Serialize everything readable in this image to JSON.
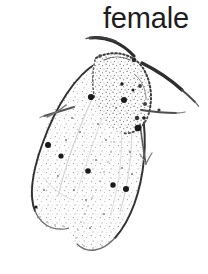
{
  "figure": {
    "caption": "female",
    "caption_color": "#1d1d1d",
    "background_color": "#ffffff",
    "style": "pen-and-ink scientific illustration",
    "width": 208,
    "height": 274
  },
  "illustration": {
    "ink_color": "#2b2b2b",
    "outline_color": "#3a3a3a",
    "stipple_color": "#8a8a8a",
    "spot_color": "#1a1a1a",
    "fill_color": "#fdfdfd",
    "parts": [
      {
        "name": "left-antenna",
        "label": "left antenna"
      },
      {
        "name": "right-antenna",
        "label": "right antenna"
      },
      {
        "name": "head",
        "label": "head"
      },
      {
        "name": "thorax",
        "label": "thorax"
      },
      {
        "name": "left-forewing",
        "label": "left forewing"
      },
      {
        "name": "right-forewing",
        "label": "right forewing"
      },
      {
        "name": "left-leg",
        "label": "left leg"
      },
      {
        "name": "right-leg",
        "label": "right leg"
      },
      {
        "name": "wing-spots",
        "label": "wing spots"
      },
      {
        "name": "wing-stipple",
        "label": "wing stippling"
      }
    ],
    "spots": [
      {
        "cx": 91,
        "cy": 97,
        "r": 3.1
      },
      {
        "cx": 124,
        "cy": 100,
        "r": 3.0
      },
      {
        "cx": 138,
        "cy": 128,
        "r": 3.3
      },
      {
        "cx": 48,
        "cy": 145,
        "r": 3.0
      },
      {
        "cx": 61,
        "cy": 156,
        "r": 2.6
      },
      {
        "cx": 88,
        "cy": 171,
        "r": 2.8
      },
      {
        "cx": 113,
        "cy": 185,
        "r": 2.7
      },
      {
        "cx": 126,
        "cy": 189,
        "r": 3.0
      },
      {
        "cx": 122,
        "cy": 84,
        "r": 1.7
      },
      {
        "cx": 133,
        "cy": 90,
        "r": 1.5
      },
      {
        "cx": 144,
        "cy": 118,
        "r": 1.8
      },
      {
        "cx": 36,
        "cy": 207,
        "r": 1.6
      }
    ]
  }
}
